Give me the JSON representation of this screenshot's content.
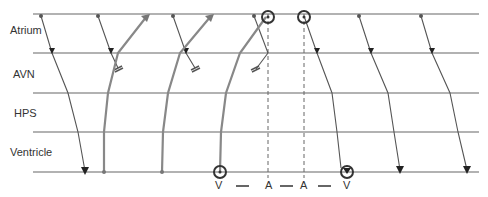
{
  "diagram": {
    "type": "ladder-diagram",
    "row_labels": [
      "Atrium",
      "AVN",
      "HPS",
      "Ventricle"
    ],
    "row_lines_y": [
      14,
      53,
      93,
      132,
      172
    ],
    "bottom_sequence": [
      "V",
      "—",
      "A",
      "—",
      "A",
      "—",
      "V"
    ],
    "colors": {
      "line": "#555555",
      "bold": "#777777",
      "text": "#333333"
    }
  }
}
